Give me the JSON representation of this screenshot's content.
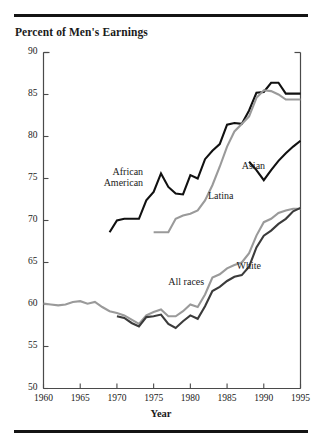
{
  "chart_data": {
    "type": "line",
    "title": "Percent of Men's Earnings",
    "xlabel": "Year",
    "ylabel": "",
    "xlim": [
      1960,
      1995
    ],
    "ylim": [
      50,
      90
    ],
    "xticks": [
      1960,
      1965,
      1970,
      1975,
      1980,
      1985,
      1990,
      1995
    ],
    "yticks": [
      50,
      55,
      60,
      65,
      70,
      75,
      80,
      85,
      90
    ],
    "grid": false,
    "legend": "inline-annotations",
    "series": [
      {
        "name": "African American",
        "color": "#111111",
        "width": 2.1,
        "label_x": 1972.2,
        "label_y": 75.2,
        "points": [
          [
            1969,
            68.6
          ],
          [
            1970,
            70.0
          ],
          [
            1971,
            70.2
          ],
          [
            1972,
            70.2
          ],
          [
            1973,
            70.2
          ],
          [
            1974,
            72.4
          ],
          [
            1975,
            73.4
          ],
          [
            1976,
            75.6
          ],
          [
            1977,
            74.0
          ],
          [
            1978,
            73.2
          ],
          [
            1979,
            73.1
          ],
          [
            1980,
            75.4
          ],
          [
            1981,
            75.0
          ],
          [
            1982,
            77.3
          ],
          [
            1983,
            78.3
          ],
          [
            1984,
            79.1
          ],
          [
            1985,
            81.4
          ],
          [
            1986,
            81.6
          ],
          [
            1987,
            81.5
          ],
          [
            1988,
            83.1
          ],
          [
            1989,
            85.2
          ],
          [
            1990,
            85.3
          ],
          [
            1991,
            86.4
          ],
          [
            1992,
            86.4
          ],
          [
            1993,
            85.1
          ],
          [
            1994,
            85.1
          ],
          [
            1995,
            85.1
          ]
        ]
      },
      {
        "name": "Latina",
        "color": "#9a9a9a",
        "width": 2.1,
        "label_x": 1982.4,
        "label_y": 72.9,
        "points": [
          [
            1975,
            68.6
          ],
          [
            1976,
            68.6
          ],
          [
            1977,
            68.6
          ],
          [
            1978,
            70.2
          ],
          [
            1979,
            70.6
          ],
          [
            1980,
            70.8
          ],
          [
            1981,
            71.2
          ],
          [
            1982,
            72.4
          ],
          [
            1983,
            74.2
          ],
          [
            1984,
            76.4
          ],
          [
            1985,
            78.8
          ],
          [
            1986,
            80.6
          ],
          [
            1987,
            81.5
          ],
          [
            1988,
            82.4
          ],
          [
            1989,
            84.6
          ],
          [
            1990,
            85.5
          ],
          [
            1991,
            85.4
          ],
          [
            1992,
            85.0
          ],
          [
            1993,
            84.4
          ],
          [
            1994,
            84.4
          ],
          [
            1995,
            84.4
          ]
        ]
      },
      {
        "name": "Asian",
        "color": "#111111",
        "width": 2.1,
        "label_x": 1987.0,
        "label_y": 76.5,
        "points": [
          [
            1988,
            77.0
          ],
          [
            1989,
            76.0
          ],
          [
            1990,
            74.8
          ],
          [
            1991,
            76.0
          ],
          [
            1992,
            77.1
          ],
          [
            1993,
            78.0
          ],
          [
            1994,
            78.8
          ],
          [
            1995,
            79.5
          ]
        ]
      },
      {
        "name": "All races",
        "color": "#9a9a9a",
        "width": 2.1,
        "label_x": 1977.0,
        "label_y": 62.7,
        "points": [
          [
            1960,
            60.1
          ],
          [
            1961,
            60.0
          ],
          [
            1962,
            59.9
          ],
          [
            1963,
            60.0
          ],
          [
            1964,
            60.3
          ],
          [
            1965,
            60.4
          ],
          [
            1966,
            60.1
          ],
          [
            1967,
            60.3
          ],
          [
            1968,
            59.7
          ],
          [
            1969,
            59.2
          ],
          [
            1970,
            59.0
          ],
          [
            1971,
            58.7
          ],
          [
            1972,
            58.2
          ],
          [
            1973,
            57.7
          ],
          [
            1974,
            58.7
          ],
          [
            1975,
            59.1
          ],
          [
            1976,
            59.4
          ],
          [
            1977,
            58.6
          ],
          [
            1978,
            58.6
          ],
          [
            1979,
            59.2
          ],
          [
            1980,
            60.0
          ],
          [
            1981,
            59.7
          ],
          [
            1982,
            61.2
          ],
          [
            1983,
            63.2
          ],
          [
            1984,
            63.6
          ],
          [
            1985,
            64.3
          ],
          [
            1986,
            64.7
          ],
          [
            1987,
            65.0
          ],
          [
            1988,
            66.1
          ],
          [
            1989,
            68.2
          ],
          [
            1990,
            69.8
          ],
          [
            1991,
            70.2
          ],
          [
            1992,
            70.9
          ],
          [
            1993,
            71.2
          ],
          [
            1994,
            71.4
          ],
          [
            1995,
            71.4
          ]
        ]
      },
      {
        "name": "White",
        "color": "#3b3b3b",
        "width": 2.1,
        "label_x": 1986.3,
        "label_y": 64.6,
        "points": [
          [
            1970,
            58.6
          ],
          [
            1971,
            58.4
          ],
          [
            1972,
            57.8
          ],
          [
            1973,
            57.4
          ],
          [
            1974,
            58.5
          ],
          [
            1975,
            58.6
          ],
          [
            1976,
            58.8
          ],
          [
            1977,
            57.7
          ],
          [
            1978,
            57.2
          ],
          [
            1979,
            58.0
          ],
          [
            1980,
            58.7
          ],
          [
            1981,
            58.3
          ],
          [
            1982,
            59.8
          ],
          [
            1983,
            61.6
          ],
          [
            1984,
            62.1
          ],
          [
            1985,
            62.8
          ],
          [
            1986,
            63.3
          ],
          [
            1987,
            63.5
          ],
          [
            1988,
            64.5
          ],
          [
            1989,
            66.8
          ],
          [
            1990,
            68.2
          ],
          [
            1991,
            68.8
          ],
          [
            1992,
            69.6
          ],
          [
            1993,
            70.2
          ],
          [
            1994,
            71.1
          ],
          [
            1995,
            71.5
          ]
        ]
      }
    ]
  },
  "axes": {
    "x_tick_labels": [
      "1960",
      "1965",
      "1970",
      "1975",
      "1980",
      "1985",
      "1990",
      "1995"
    ],
    "y_tick_labels": [
      "90",
      "85",
      "80",
      "75",
      "70",
      "65",
      "60",
      "55",
      "50"
    ]
  },
  "labels": {
    "title": "Percent of Men's Earnings",
    "x_axis_title": "Year",
    "african_american": "African\nAmerican",
    "african_american_line1": "African",
    "african_american_line2": "American",
    "latina": "Latina",
    "asian": "Asian",
    "all_races": "All races",
    "white": "White"
  },
  "colors": {
    "dark": "#111111",
    "gray": "#9a9a9a",
    "mid_dark": "#3b3b3b",
    "axis": "#4a4a4a",
    "rule": "#141414"
  }
}
